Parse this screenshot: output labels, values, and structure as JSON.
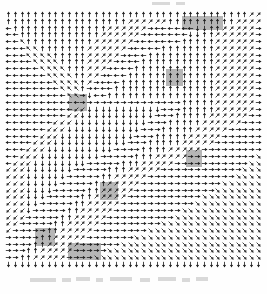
{
  "figure": {
    "title": "",
    "subtitle": "",
    "type_label": "vector-field",
    "background_color": "#ffffff",
    "arrow_color": "#1c1c1c",
    "highlight_color": "#9a9a9a"
  },
  "chart_data": {
    "type": "scatter",
    "plot_kind": "quiver",
    "title": "",
    "xlabel": "",
    "ylabel": "",
    "grid": false,
    "legend": null,
    "annotations": [],
    "xlim": [
      0,
      38
    ],
    "ylim": [
      0,
      38
    ],
    "tick_labels_x": [],
    "tick_labels_y": [],
    "grid_cols": 38,
    "grid_rows": 38,
    "cell_px": 6.75,
    "origin_px": [
      5,
      11
    ],
    "direction_codes": "0=right 1=up-right 2=up 3=up-left 4=left 5=down-left 6=down 7=down-right",
    "direction_angles_deg": [
      0,
      45,
      90,
      135,
      180,
      225,
      270,
      315
    ],
    "sinks": [
      {
        "col": 24,
        "row": 10,
        "label": "sink-a"
      },
      {
        "col": 11,
        "row": 14,
        "label": "sink-b"
      },
      {
        "col": 27,
        "row": 23,
        "label": "sink-c"
      },
      {
        "col": 16,
        "row": 27,
        "label": "sink-d"
      },
      {
        "col": 6,
        "row": 34,
        "label": "sink-e"
      }
    ],
    "highlight_rects": [
      {
        "x": 182,
        "y": 16,
        "w": 41,
        "h": 14,
        "label": "block-top-right"
      },
      {
        "x": 166,
        "y": 69,
        "w": 17,
        "h": 17,
        "label": "block-sink-a"
      },
      {
        "x": 69,
        "y": 94,
        "w": 18,
        "h": 17,
        "label": "block-sink-b"
      },
      {
        "x": 186,
        "y": 150,
        "w": 16,
        "h": 17,
        "label": "block-sink-c"
      },
      {
        "x": 100,
        "y": 182,
        "w": 18,
        "h": 18,
        "label": "block-sink-d"
      },
      {
        "x": 35,
        "y": 228,
        "w": 20,
        "h": 18,
        "label": "block-sink-e"
      },
      {
        "x": 68,
        "y": 243,
        "w": 33,
        "h": 17,
        "label": "block-bottom"
      }
    ],
    "field": [
      "22222222222222222222222222222222222211",
      "22222222222222222211111122222222221111",
      "42222222222222211111104444446622111110",
      "44222222222222111111044444466221111110",
      "44322222222221111110444444222221111110",
      "44433222222211111104444222222221111110",
      "44433332222211111044422222222221111110",
      "44443333222211110444222222222221111110",
      "44444333322211104442222222222221111110",
      "44444433332211044422222222222221111110",
      "44444443333210444222222222222221111110",
      "44444444333204442222222222222221111110",
      "44444444433064422222222222222221111110",
      "44444444444000000000000000222221111110",
      "44444444445566666666666000222221111110",
      "44444444455666666666660002222211111100",
      "44444445556666666666600022222111111000",
      "44444455566666666666000222221111100000",
      "44444555666666666660002222211111000000",
      "44445556666666666600022222111110000000",
      "44455566666666660000222211111000000000",
      "44555666666666000002221111100000000007",
      "45556666666600000222111110000000000077",
      "55566666660000022211111000000000000777",
      "55566666600000221111100000000000007777",
      "55566666000002211111000000000000777777",
      "55566660000022111110000000000007777777",
      "55566600000221111100000000000777777777",
      "55566000002211111000000000007777777777",
      "55560000022111110000000000777777777777",
      "55500000221111100000000007777777777777",
      "55000002211111000000000777777777777777",
      "50000022111110000000077777777777777777",
      "00000221111100000007777777777777777777",
      "00002211111000000777777777777777777777",
      "00022111110000077777777777777777777777",
      "00221111100007777777777777777777777777",
      "66666666666666666666666666666666666666"
    ]
  },
  "specks": [
    {
      "x": 30,
      "y": 278,
      "w": 26,
      "h": 4
    },
    {
      "x": 62,
      "y": 278,
      "w": 9,
      "h": 4
    },
    {
      "x": 76,
      "y": 277,
      "w": 14,
      "h": 4
    },
    {
      "x": 96,
      "y": 278,
      "w": 7,
      "h": 4
    },
    {
      "x": 110,
      "y": 277,
      "w": 22,
      "h": 4
    },
    {
      "x": 140,
      "y": 278,
      "w": 10,
      "h": 4
    },
    {
      "x": 158,
      "y": 277,
      "w": 18,
      "h": 4
    },
    {
      "x": 182,
      "y": 278,
      "w": 8,
      "h": 4
    },
    {
      "x": 196,
      "y": 277,
      "w": 12,
      "h": 4
    },
    {
      "x": 152,
      "y": 2,
      "w": 18,
      "h": 3
    },
    {
      "x": 176,
      "y": 2,
      "w": 9,
      "h": 3
    }
  ]
}
